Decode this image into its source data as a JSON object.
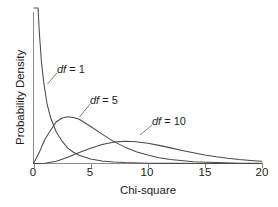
{
  "chart_data": {
    "type": "line",
    "title": "",
    "subtitle": "",
    "xlabel": "Chi-square",
    "ylabel": "Probability Density",
    "xlim": [
      0,
      20
    ],
    "ylim": [
      0,
      0.5
    ],
    "grid": false,
    "legend_position": "inline-annotations",
    "xticks": [
      {
        "value": 0,
        "label": "0"
      },
      {
        "value": 5,
        "label": "5"
      },
      {
        "value": 10,
        "label": "10"
      },
      {
        "value": 15,
        "label": "15"
      },
      {
        "value": 20,
        "label": "20"
      }
    ],
    "yticks": [],
    "annotations": [
      {
        "id": "df1",
        "text_italic": "df",
        "text_rest": " = 1",
        "x": 3.7,
        "y": 0.285
      },
      {
        "id": "df5",
        "text_italic": "df",
        "text_rest": " = 5",
        "x": 7.0,
        "y": 0.185
      },
      {
        "id": "df10",
        "text_italic": "df",
        "text_rest": " = 10",
        "x": 13.0,
        "y": 0.135
      }
    ],
    "series": [
      {
        "name": "df = 1",
        "df": 1,
        "color": "#4a4a4a",
        "x": [
          0.05,
          0.1,
          0.15,
          0.2,
          0.3,
          0.4,
          0.5,
          0.7,
          0.9,
          1.2,
          1.5,
          2.0,
          2.5,
          3.0,
          3.5,
          4.0,
          5.0,
          6.0,
          7.0,
          8.0,
          10.0,
          12.0,
          15.0,
          20.0
        ],
        "y": [
          1.753,
          1.2,
          0.957,
          0.807,
          0.628,
          0.527,
          0.439,
          0.333,
          0.266,
          0.194,
          0.151,
          0.103,
          0.074,
          0.051,
          0.037,
          0.027,
          0.015,
          0.008,
          0.005,
          0.003,
          0.001,
          0.0004,
          0.0001,
          2e-05
        ]
      },
      {
        "name": "df = 5",
        "df": 5,
        "color": "#4a4a4a",
        "x": [
          0.0,
          0.5,
          1.0,
          1.5,
          2.0,
          2.5,
          3.0,
          3.5,
          4.0,
          5.0,
          6.0,
          7.0,
          8.0,
          9.0,
          10.0,
          11.0,
          12.0,
          14.0,
          16.0,
          18.0,
          20.0
        ],
        "y": [
          0.0,
          0.036,
          0.08,
          0.11,
          0.138,
          0.15,
          0.154,
          0.152,
          0.146,
          0.122,
          0.097,
          0.073,
          0.054,
          0.039,
          0.028,
          0.019,
          0.013,
          0.006,
          0.003,
          0.001,
          0.0005
        ]
      },
      {
        "name": "df = 10",
        "df": 10,
        "color": "#4a4a4a",
        "x": [
          0.0,
          1.0,
          2.0,
          3.0,
          4.0,
          5.0,
          6.0,
          7.0,
          8.0,
          9.0,
          10.0,
          11.0,
          12.0,
          13.0,
          14.0,
          15.0,
          16.0,
          17.0,
          18.0,
          19.0,
          20.0
        ],
        "y": [
          0.0,
          0.0008,
          0.0077,
          0.0203,
          0.036,
          0.0501,
          0.0627,
          0.0705,
          0.0733,
          0.0719,
          0.0668,
          0.0598,
          0.0516,
          0.0432,
          0.0353,
          0.0283,
          0.0223,
          0.0173,
          0.0132,
          0.01,
          0.0075
        ]
      }
    ]
  },
  "axes": {
    "x_title": "Chi-square",
    "y_title": "Probability Density"
  }
}
